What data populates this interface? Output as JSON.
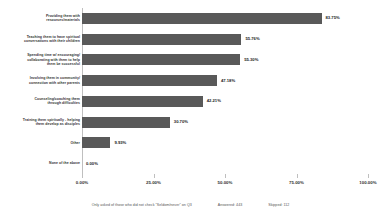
{
  "chart_data": {
    "type": "bar",
    "orientation": "horizontal",
    "title": "",
    "xlabel": "",
    "ylabel": "",
    "xlim": [
      0,
      100
    ],
    "grid": false,
    "legend": null,
    "categories": [
      "Providing them with\nresources/materials",
      "Teaching them to have spiritual\nconversations with their children",
      "Spending time w/ encouraging/\ncollaborating with them to help\nthem be successful",
      "Involving them in community/\nconnection with other parents",
      "Counseling/coaching them\nthrough difficulties",
      "Training them spiritually - helping\nthem develop as disciples",
      "Other",
      "None of the above"
    ],
    "values": [
      83.75,
      55.76,
      55.3,
      47.18,
      42.21,
      30.7,
      9.93,
      0.0
    ],
    "value_labels": [
      "83.75%",
      "55.76%",
      "55.30%",
      "47.18%",
      "42.21%",
      "30.70%",
      "9.93%",
      "0.00%"
    ],
    "tick_values": [
      0,
      25,
      50,
      75,
      100
    ],
    "tick_labels": [
      "0.00%",
      "25.00%",
      "50.00%",
      "75.00%",
      "100.00%"
    ],
    "bar_color": "#595959",
    "axis_color": "#bfbfbf"
  },
  "footer": {
    "note": "Only asked of those who did not check \"Seldom/never\" on Q3",
    "answered": "Answered: 443",
    "skipped": "Skipped: 112"
  }
}
